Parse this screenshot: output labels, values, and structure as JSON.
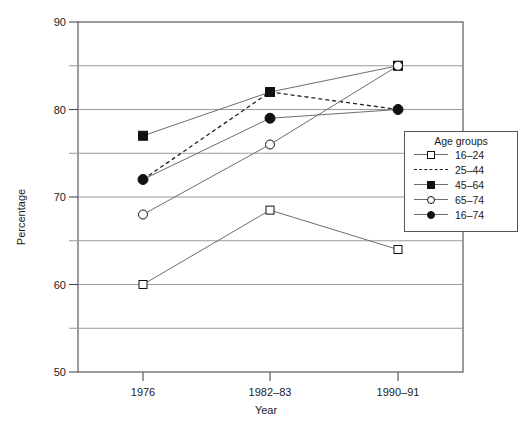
{
  "chart_data": {
    "type": "line",
    "title": "",
    "xlabel": "Year",
    "ylabel": "Percentage",
    "categories": [
      "1976",
      "1982–83",
      "1990–91"
    ],
    "ylim": [
      50,
      90
    ],
    "yticks": [
      50,
      60,
      70,
      80,
      90
    ],
    "ytick_labels": [
      "50",
      "60",
      "70",
      "80",
      "90"
    ],
    "minor_gridlines": [
      55,
      65,
      75,
      85
    ],
    "grid": true,
    "legend_position": "right",
    "legend_title": "Age groups",
    "series": [
      {
        "name": "16–24",
        "marker": "square-open",
        "line": "solid",
        "values": [
          60,
          68.5,
          64
        ]
      },
      {
        "name": "25–44",
        "marker": "none",
        "line": "dashed",
        "values": [
          72,
          82,
          80
        ]
      },
      {
        "name": "45–64",
        "marker": "square-filled",
        "line": "solid",
        "values": [
          77,
          82,
          85
        ]
      },
      {
        "name": "65–74",
        "marker": "circle-open",
        "line": "solid",
        "values": [
          68,
          76,
          85
        ]
      },
      {
        "name": "16–74",
        "marker": "circle-filled",
        "line": "solid",
        "values": [
          72,
          79,
          80
        ]
      }
    ]
  },
  "legend": {
    "title": "Age groups",
    "items": [
      {
        "label": "16–24",
        "key": "square-open-line"
      },
      {
        "label": "25–44",
        "key": "dashed-line"
      },
      {
        "label": "45–64",
        "key": "square-filled-line"
      },
      {
        "label": "65–74",
        "key": "circle-open-line"
      },
      {
        "label": "16–74",
        "key": "circle-filled-line"
      }
    ]
  },
  "axes": {
    "y_title": "Percentage",
    "x_title": "Year"
  },
  "colors": {
    "line": "#6d6d6d",
    "dashed_line": "#222222",
    "marker_fill": "#111111",
    "marker_open": "#ffffff",
    "grid": "#9a9a9a",
    "axis": "#4a4a4a",
    "text": "#1a1a1a"
  }
}
